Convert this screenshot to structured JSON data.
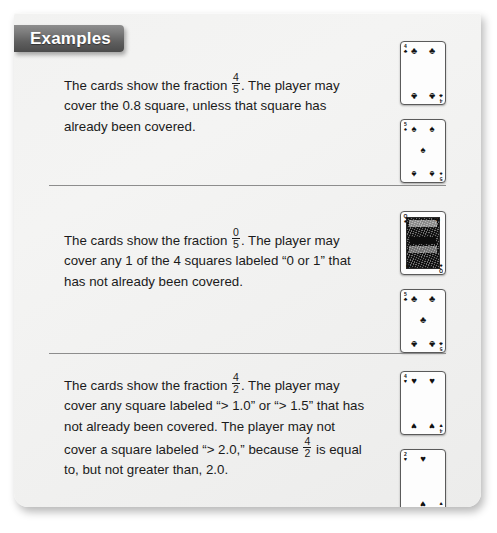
{
  "banner": {
    "label": "Examples"
  },
  "examples": [
    {
      "id": "example-1",
      "text_parts": {
        "lead": "The cards show the fraction ",
        "frac_num": "4",
        "frac_den": "5",
        "rest": ". The player may cover the 0.8 square, unless that square has already been covered."
      },
      "cards": [
        {
          "rank": "4",
          "suit": "club",
          "suit_glyph": "♣",
          "name": "four-of-clubs"
        },
        {
          "rank": "5",
          "suit": "spade",
          "suit_glyph": "♠",
          "name": "five-of-spades"
        }
      ]
    },
    {
      "id": "example-2",
      "text_parts": {
        "lead": "The cards show the fraction ",
        "frac_num": "0",
        "frac_den": "5",
        "rest": ". The player may cover any 1 of the 4 squares labeled “0 or 1” that has not already been covered."
      },
      "cards": [
        {
          "rank": "Q",
          "suit": "spade",
          "suit_glyph": "♠",
          "name": "queen-of-spades"
        },
        {
          "rank": "5",
          "suit": "club",
          "suit_glyph": "♣",
          "name": "five-of-clubs"
        }
      ]
    },
    {
      "id": "example-3",
      "text_parts": {
        "lead": "The cards show the fraction ",
        "frac_num": "4",
        "frac_den": "2",
        "rest": ". The player may cover any square labeled “> 1.0” or “> 1.5” that has not already been covered. The player may not cover a square labeled “> 2.0,” because ",
        "frac2_num": "4",
        "frac2_den": "2",
        "tail": " is equal to, but not greater than, 2.0."
      },
      "cards": [
        {
          "rank": "4",
          "suit": "heart",
          "suit_glyph": "♥",
          "name": "four-of-hearts"
        },
        {
          "rank": "2",
          "suit": "heart",
          "suit_glyph": "♥",
          "name": "two-of-hearts"
        }
      ]
    }
  ],
  "colors": {
    "page_background": "#f1f1f0",
    "banner_background": "#5f5f5f",
    "banner_text": "#ffffff",
    "body_text": "#1b1b1b",
    "divider": "#8d8d8d",
    "card_face": "#fdfdfd",
    "card_border": "#5a5a5a"
  }
}
